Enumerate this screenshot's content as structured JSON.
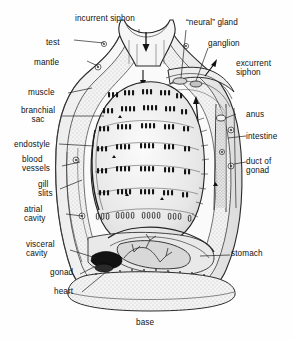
{
  "figure": {
    "title_caption": "base",
    "style": "grayscale pen-and-ink biological line drawing with stipple shading",
    "colors": {
      "background": "#fefefe",
      "ink": "#111111",
      "line": "#2a2a2a",
      "shade_light": "#e8e8e8",
      "shade_mid": "#c9c9c9",
      "shade_dark": "#8a8a8a",
      "stipple": "#6f6f6f"
    },
    "labels": [
      {
        "id": "incurrent-siphon",
        "text": "incurrent siphon",
        "x": 75,
        "y": 18,
        "align": "left",
        "lines": 1
      },
      {
        "id": "test",
        "text": "test",
        "x": 70,
        "y": 42,
        "align": "right",
        "lines": 1
      },
      {
        "id": "mantle",
        "text": "mantle",
        "x": 57,
        "y": 62,
        "align": "right",
        "lines": 1
      },
      {
        "id": "muscle",
        "text": "muscle",
        "x": 30,
        "y": 92,
        "align": "left",
        "lines": 1
      },
      {
        "id": "branchial-sac",
        "text": "branchial\nsac",
        "x": 22,
        "y": 110,
        "align": "left",
        "lines": 2
      },
      {
        "id": "endostyle",
        "text": "endostyle",
        "x": 16,
        "y": 143,
        "align": "left",
        "lines": 1
      },
      {
        "id": "blood-vessels",
        "text": "blood\nvessels",
        "x": 24,
        "y": 158,
        "align": "left",
        "lines": 2
      },
      {
        "id": "gill-slits",
        "text": "gill\nslits",
        "x": 38,
        "y": 182,
        "align": "left",
        "lines": 2
      },
      {
        "id": "atrial-cavity",
        "text": "atrial\ncavity",
        "x": 26,
        "y": 208,
        "align": "left",
        "lines": 2
      },
      {
        "id": "visceral-cavity",
        "text": "visceral\ncavity",
        "x": 28,
        "y": 243,
        "align": "left",
        "lines": 2
      },
      {
        "id": "gonad",
        "text": "gonad",
        "x": 52,
        "y": 272,
        "align": "left",
        "lines": 1
      },
      {
        "id": "heart",
        "text": "heart",
        "x": 56,
        "y": 290,
        "align": "left",
        "lines": 1
      },
      {
        "id": "neural-gland",
        "text": "“neural” gland",
        "x": 188,
        "y": 22,
        "align": "left",
        "lines": 1
      },
      {
        "id": "ganglion",
        "text": "ganglion",
        "x": 210,
        "y": 43,
        "align": "left",
        "lines": 1
      },
      {
        "id": "excurrent-siphon",
        "text": "excurrent\nsiphon",
        "x": 238,
        "y": 62,
        "align": "left",
        "lines": 2
      },
      {
        "id": "anus",
        "text": "anus",
        "x": 248,
        "y": 114,
        "align": "left",
        "lines": 1
      },
      {
        "id": "intestine",
        "text": "intestine",
        "x": 248,
        "y": 136,
        "align": "left",
        "lines": 1
      },
      {
        "id": "duct-of-gonad",
        "text": "duct of\ngonad",
        "x": 248,
        "y": 160,
        "align": "left",
        "lines": 2
      },
      {
        "id": "stomach",
        "text": "stomach",
        "x": 232,
        "y": 252,
        "align": "left",
        "lines": 1
      },
      {
        "id": "base",
        "text": "base",
        "x": 137,
        "y": 320,
        "align": "left",
        "lines": 1
      }
    ],
    "flow_arrows": [
      {
        "id": "incurrent-flow-arrow",
        "direction": "down",
        "meaning": "water entering incurrent siphon"
      },
      {
        "id": "pharynx-flow-arrow",
        "direction": "down",
        "meaning": "water into branchial sac"
      },
      {
        "id": "atrial-flow-arrow",
        "direction": "up",
        "meaning": "water leaving atrial cavity"
      },
      {
        "id": "excurrent-flow-arrow",
        "direction": "up-right",
        "meaning": "water exiting excurrent siphon"
      }
    ]
  }
}
